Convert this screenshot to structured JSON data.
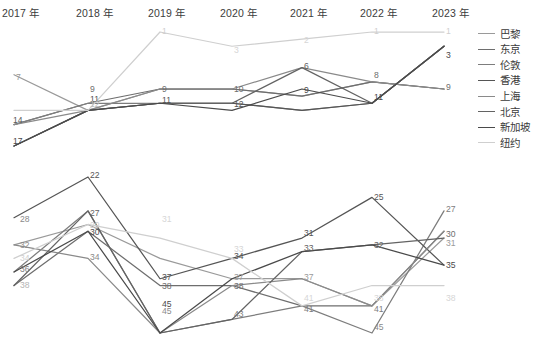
{
  "axis": {
    "categories": [
      "2017 年",
      "2018 年",
      "2019 年",
      "2020 年",
      "2021 年",
      "2022 年",
      "2023 年"
    ]
  },
  "legend": {
    "title": "",
    "items": [
      {
        "label": "巴黎",
        "color": "#9a9a9a"
      },
      {
        "label": "东京",
        "color": "#6e6e6e"
      },
      {
        "label": "伦敦",
        "color": "#7d7d7d"
      },
      {
        "label": "香港",
        "color": "#555555"
      },
      {
        "label": "上海",
        "color": "#8a8a8a"
      },
      {
        "label": "北京",
        "color": "#636363"
      },
      {
        "label": "新加坡",
        "color": "#4a4a4a"
      },
      {
        "label": "纽约",
        "color": "#cfcfcf"
      }
    ]
  },
  "chart_data": [
    {
      "type": "line",
      "title": "",
      "subtitle": "top panel — city rank by year (lower number = higher rank)",
      "xlabel": "",
      "ylabel": "",
      "grid": false,
      "legend_position": "right",
      "categories": [
        "2017 年",
        "2018 年",
        "2019 年",
        "2020 年",
        "2021 年",
        "2022 年",
        "2023 年"
      ],
      "ylim": [
        1,
        17
      ],
      "series": [
        {
          "name": "巴黎",
          "color": "#9a9a9a",
          "values": [
            7,
            12,
            9,
            9,
            10,
            8,
            9
          ]
        },
        {
          "name": "东京",
          "color": "#6e6e6e",
          "values": [
            14,
            11,
            9,
            9,
            10,
            8,
            9
          ]
        },
        {
          "name": "伦敦",
          "color": "#7d7d7d",
          "values": [
            14,
            11,
            11,
            11,
            12,
            11,
            3
          ]
        },
        {
          "name": "香港",
          "color": "#555555",
          "values": [
            17,
            12,
            11,
            11,
            12,
            11,
            3
          ]
        },
        {
          "name": "上海",
          "color": "#8a8a8a",
          "values": [
            14,
            12,
            9,
            9,
            6,
            8,
            9
          ]
        },
        {
          "name": "北京",
          "color": "#636363",
          "values": [
            17,
            12,
            11,
            11,
            6,
            11,
            3
          ]
        },
        {
          "name": "新加坡",
          "color": "#4a4a4a",
          "values": [
            17,
            12,
            11,
            12,
            9,
            11,
            3
          ]
        },
        {
          "name": "纽约",
          "color": "#cfcfcf",
          "values": [
            12,
            12,
            1,
            3,
            2,
            1,
            1
          ]
        }
      ]
    },
    {
      "type": "line",
      "title": "",
      "subtitle": "bottom panel — city score by year",
      "xlabel": "",
      "ylabel": "",
      "grid": false,
      "legend_position": "right",
      "categories": [
        "2017 年",
        "2018 年",
        "2019 年",
        "2020 年",
        "2021 年",
        "2022 年",
        "2023 年"
      ],
      "ylim": [
        22,
        45
      ],
      "series": [
        {
          "name": "巴黎",
          "color": "#9a9a9a",
          "values": [
            32,
            29,
            34,
            37,
            37,
            41,
            31
          ]
        },
        {
          "name": "东京",
          "color": "#6e6e6e",
          "values": [
            38,
            30,
            38,
            38,
            41,
            41,
            30
          ]
        },
        {
          "name": "伦敦",
          "color": "#7d7d7d",
          "values": [
            36,
            27,
            45,
            43,
            41,
            45,
            27
          ]
        },
        {
          "name": "香港",
          "color": "#555555",
          "values": [
            28,
            22,
            37,
            34,
            31,
            25,
            35
          ]
        },
        {
          "name": "上海",
          "color": "#8a8a8a",
          "values": [
            32,
            34,
            45,
            38,
            37,
            41,
            30
          ]
        },
        {
          "name": "北京",
          "color": "#636363",
          "values": [
            38,
            27,
            45,
            43,
            33,
            32,
            31
          ]
        },
        {
          "name": "新加坡",
          "color": "#4a4a4a",
          "values": [
            36,
            30,
            45,
            37,
            33,
            32,
            35
          ]
        },
        {
          "name": "纽约",
          "color": "#cfcfcf",
          "values": [
            34,
            29,
            31,
            34,
            41,
            38,
            38
          ]
        }
      ]
    }
  ],
  "point_labels": {
    "top": [
      {
        "x": 14,
        "y": 80,
        "text": "7",
        "color": "#9a9a9a"
      },
      {
        "x": 11,
        "y": 123,
        "text": "14",
        "color": "#5a5a5a"
      },
      {
        "x": 11,
        "y": 144,
        "text": "17",
        "color": "#4a4a4a"
      },
      {
        "x": 88,
        "y": 92,
        "text": "9",
        "color": "#6e6e6e"
      },
      {
        "x": 88,
        "y": 102,
        "text": "11",
        "color": "#555555"
      },
      {
        "x": 88,
        "y": 107,
        "text": "12",
        "color": "#bdbdbd"
      },
      {
        "x": 160,
        "y": 34,
        "text": "1",
        "color": "#cfcfcf"
      },
      {
        "x": 160,
        "y": 92,
        "text": "9",
        "color": "#6e6e6e"
      },
      {
        "x": 160,
        "y": 103,
        "text": "11",
        "color": "#555555"
      },
      {
        "x": 232,
        "y": 53,
        "text": "3",
        "color": "#d6d6d6"
      },
      {
        "x": 232,
        "y": 92,
        "text": "10",
        "color": "#6e6e6e"
      },
      {
        "x": 232,
        "y": 107,
        "text": "12",
        "color": "#555555"
      },
      {
        "x": 302,
        "y": 43,
        "text": "2",
        "color": "#d6d6d6"
      },
      {
        "x": 302,
        "y": 69,
        "text": "6",
        "color": "#636363"
      },
      {
        "x": 302,
        "y": 93,
        "text": "9",
        "color": "#4a4a4a"
      },
      {
        "x": 372,
        "y": 34,
        "text": "1",
        "color": "#cfcfcf"
      },
      {
        "x": 372,
        "y": 78,
        "text": "8",
        "color": "#6e6e6e"
      },
      {
        "x": 372,
        "y": 100,
        "text": "11",
        "color": "#4a4a4a"
      },
      {
        "x": 444,
        "y": 34,
        "text": "1",
        "color": "#cfcfcf"
      },
      {
        "x": 444,
        "y": 58,
        "text": "3",
        "color": "#4a4a4a"
      },
      {
        "x": 444,
        "y": 90,
        "text": "9",
        "color": "#6e6e6e"
      }
    ],
    "bottom": [
      {
        "x": 18,
        "y": 222,
        "text": "28",
        "color": "#8a8a8a"
      },
      {
        "x": 18,
        "y": 248,
        "text": "32",
        "color": "#8a8a8a"
      },
      {
        "x": 18,
        "y": 261,
        "text": "34",
        "color": "#cfcfcf"
      },
      {
        "x": 18,
        "y": 272,
        "text": "36",
        "color": "#7d7d7d"
      },
      {
        "x": 18,
        "y": 288,
        "text": "38",
        "color": "#b5b5b5"
      },
      {
        "x": 88,
        "y": 178,
        "text": "22",
        "color": "#555555"
      },
      {
        "x": 88,
        "y": 216,
        "text": "27",
        "color": "#636363"
      },
      {
        "x": 88,
        "y": 228,
        "text": "29",
        "color": "#cfcfcf"
      },
      {
        "x": 88,
        "y": 235,
        "text": "30",
        "color": "#4a4a4a"
      },
      {
        "x": 88,
        "y": 260,
        "text": "34",
        "color": "#8a8a8a"
      },
      {
        "x": 160,
        "y": 222,
        "text": "31",
        "color": "#d6d6d6"
      },
      {
        "x": 160,
        "y": 280,
        "text": "37",
        "color": "#555555"
      },
      {
        "x": 160,
        "y": 289,
        "text": "38",
        "color": "#6e6e6e"
      },
      {
        "x": 160,
        "y": 307,
        "text": "45",
        "color": "#4a4a4a"
      },
      {
        "x": 160,
        "y": 314,
        "text": "45",
        "color": "#8a8a8a"
      },
      {
        "x": 232,
        "y": 252,
        "text": "33",
        "color": "#d6d6d6"
      },
      {
        "x": 232,
        "y": 259,
        "text": "34",
        "color": "#555555"
      },
      {
        "x": 232,
        "y": 280,
        "text": "37",
        "color": "#9a9a9a"
      },
      {
        "x": 232,
        "y": 289,
        "text": "38",
        "color": "#6e6e6e"
      },
      {
        "x": 232,
        "y": 317,
        "text": "43",
        "color": "#7d7d7d"
      },
      {
        "x": 302,
        "y": 236,
        "text": "31",
        "color": "#555555"
      },
      {
        "x": 302,
        "y": 251,
        "text": "33",
        "color": "#636363"
      },
      {
        "x": 302,
        "y": 280,
        "text": "37",
        "color": "#9a9a9a"
      },
      {
        "x": 302,
        "y": 301,
        "text": "41",
        "color": "#d6d6d6"
      },
      {
        "x": 302,
        "y": 312,
        "text": "41",
        "color": "#7d7d7d"
      },
      {
        "x": 372,
        "y": 200,
        "text": "25",
        "color": "#555555"
      },
      {
        "x": 372,
        "y": 248,
        "text": "32",
        "color": "#636363"
      },
      {
        "x": 372,
        "y": 301,
        "text": "38",
        "color": "#d6d6d6"
      },
      {
        "x": 372,
        "y": 312,
        "text": "41",
        "color": "#7d7d7d"
      },
      {
        "x": 372,
        "y": 330,
        "text": "45",
        "color": "#8a8a8a"
      },
      {
        "x": 444,
        "y": 212,
        "text": "27",
        "color": "#7d7d7d"
      },
      {
        "x": 444,
        "y": 237,
        "text": "30",
        "color": "#6e6e6e"
      },
      {
        "x": 444,
        "y": 246,
        "text": "31",
        "color": "#9a9a9a"
      },
      {
        "x": 444,
        "y": 268,
        "text": "35",
        "color": "#4a4a4a"
      },
      {
        "x": 444,
        "y": 301,
        "text": "38",
        "color": "#d6d6d6"
      }
    ]
  }
}
